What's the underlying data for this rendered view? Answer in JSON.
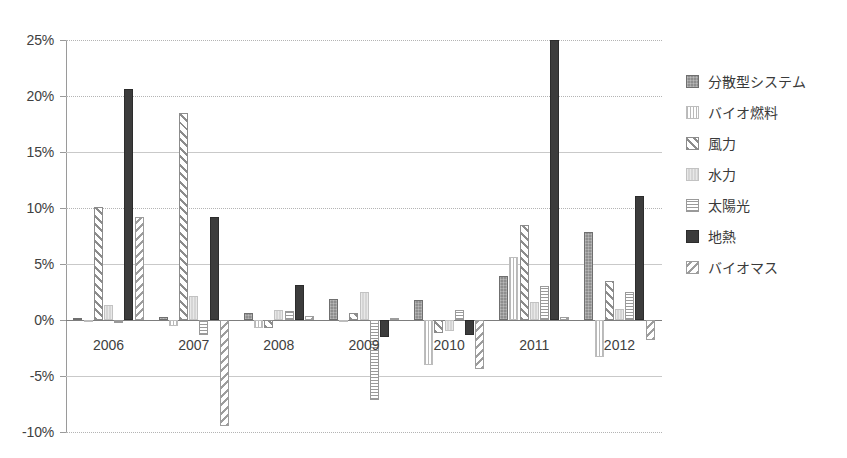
{
  "chart_data": {
    "type": "bar",
    "title": "",
    "subtitle": "",
    "xlabel": "",
    "ylabel": "",
    "grid": true,
    "legend_position": "right",
    "orientation": "vertical",
    "grouping": "grouped",
    "value_format": "percent",
    "ylim": [
      -10,
      25
    ],
    "ytick_step": 5,
    "ytick_labels": [
      "25%",
      "20%",
      "15%",
      "10%",
      "5%",
      "0%",
      "-5%",
      "-10%"
    ],
    "ytick_values": [
      25,
      20,
      15,
      10,
      5,
      0,
      -5,
      -10
    ],
    "categories": [
      "2006",
      "2007",
      "2008",
      "2009",
      "2010",
      "2011",
      "2012"
    ],
    "series": [
      {
        "name": "分散型システム",
        "pattern": "solid-grey-texture",
        "color": "#8e8e8e",
        "values": [
          0.2,
          0.3,
          0.6,
          1.9,
          1.8,
          3.9,
          7.9
        ]
      },
      {
        "name": "バイオ燃料",
        "pattern": "vertical-lines",
        "color": "#b9b9b9",
        "values": [
          0.0,
          -0.5,
          -0.7,
          -0.2,
          -4.0,
          5.6,
          -3.3
        ]
      },
      {
        "name": "風力",
        "pattern": "diagonal-hatch",
        "color": "#8c8c8c",
        "values": [
          10.1,
          18.5,
          -0.7,
          0.6,
          -1.2,
          8.5,
          3.5
        ]
      },
      {
        "name": "水力",
        "pattern": "light-grey",
        "color": "#d5d5d5",
        "values": [
          1.3,
          2.1,
          0.9,
          2.5,
          -1.0,
          1.6,
          1.0
        ]
      },
      {
        "name": "太陽光",
        "pattern": "horizontal-lines",
        "color": "#9a9a9a",
        "values": [
          -0.3,
          -1.3,
          0.8,
          -7.1,
          0.9,
          3.0,
          2.5
        ]
      },
      {
        "name": "地熱",
        "pattern": "solid-dark",
        "color": "#3c3c3c",
        "values": [
          20.6,
          9.2,
          3.1,
          -1.5,
          -1.3,
          25.0,
          11.1
        ]
      },
      {
        "name": "バイオマス",
        "pattern": "back-diagonal-hatch",
        "color": "#9d9d9d",
        "values": [
          9.2,
          -9.5,
          0.4,
          0.2,
          -4.4,
          0.3,
          -1.8
        ]
      }
    ],
    "notes": [
      "地熱 2011 bar is clipped at the top of the plot area (value at or above 25%)."
    ]
  }
}
